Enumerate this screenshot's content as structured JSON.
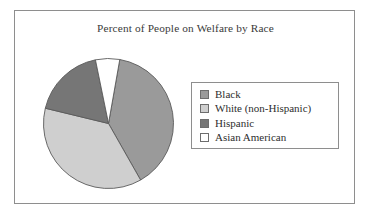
{
  "figure": {
    "border_color": "#8e8e8e",
    "background": "#ffffff"
  },
  "chart_data": {
    "type": "pie",
    "title": "Percent of People on Welfare by Race",
    "xlabel": "",
    "ylabel": "",
    "categories": [
      "Black",
      "White (non-Hispanic)",
      "Hispanic",
      "Asian American"
    ],
    "values": [
      39,
      37,
      18,
      6
    ],
    "unit": "percent",
    "colors": [
      "#9a9a9a",
      "#cfcfcf",
      "#767676",
      "#ffffff"
    ],
    "slice_border_color": "#5a5a5a",
    "start_angle_deg": 10,
    "direction": "clockwise",
    "legend": {
      "position": "right",
      "border_color": "#8e8e8e",
      "entries": [
        {
          "label": "Black",
          "color": "#9a9a9a",
          "value": 39
        },
        {
          "label": "White (non-Hispanic)",
          "color": "#cfcfcf",
          "value": 37
        },
        {
          "label": "Hispanic",
          "color": "#767676",
          "value": 18
        },
        {
          "label": "Asian American",
          "color": "#ffffff",
          "value": 6
        }
      ]
    },
    "grid": false
  }
}
